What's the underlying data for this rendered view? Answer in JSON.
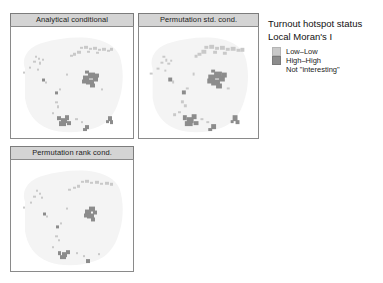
{
  "figure": {
    "background": "#ffffff",
    "panels": [
      {
        "id": "analytical-conditional",
        "title": "Analytical conditional",
        "x": 10,
        "y": 13,
        "w": 124,
        "h": 126
      },
      {
        "id": "permutation-std-cond",
        "title": "Permutation std. cond.",
        "x": 138,
        "y": 13,
        "w": 121,
        "h": 126
      },
      {
        "id": "permutation-rank-cond",
        "title": "Permutation rank cond.",
        "x": 10,
        "y": 146,
        "w": 124,
        "h": 126
      }
    ]
  },
  "legend": {
    "x": 268,
    "y": 17,
    "title": "Turnout hotspot status",
    "subtitle": "Local Moran's I",
    "items": [
      {
        "label": "Low–Low",
        "color": "#c9c9c9",
        "border": "#b4b4b4"
      },
      {
        "label": "High–High",
        "color": "#8c8c8c",
        "border": "#7a7a7a"
      },
      {
        "label": "Not \"interesting\"",
        "color": "#ffffff",
        "border": "#ffffff"
      }
    ]
  },
  "chart_data": {
    "type": "map",
    "subtype": "lisa-cluster-small-multiples",
    "title": "Turnout hotspot status",
    "subtitle": "Local Moran's I",
    "categories": [
      "Low–Low",
      "High–High",
      "Not \"interesting\""
    ],
    "colors": {
      "low_low": "#c9c9c9",
      "high_high": "#8c8c8c",
      "not_interesting": "#ffffff",
      "basemap": "#f4f4f4"
    },
    "legend_position": "right",
    "grid": false,
    "panels": [
      {
        "name": "Analytical conditional",
        "low_low_clusters": 14,
        "high_high_clusters": 9
      },
      {
        "name": "Permutation std. cond.",
        "low_low_clusters": 13,
        "high_high_clusters": 9
      },
      {
        "name": "Permutation rank cond.",
        "low_low_clusters": 11,
        "high_high_clusters": 7
      }
    ]
  }
}
